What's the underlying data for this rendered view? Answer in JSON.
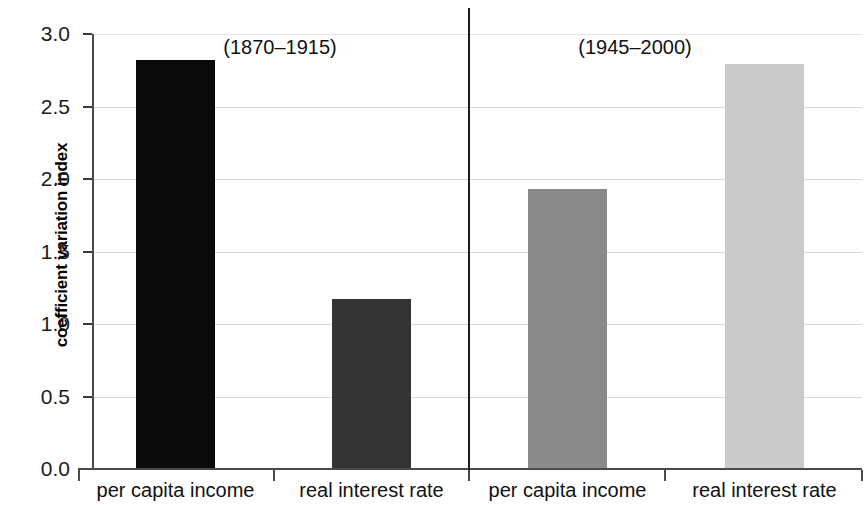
{
  "chart_data": {
    "type": "bar",
    "title": "",
    "subtitle": "",
    "xlabel": "",
    "ylabel": "coefficient variation index",
    "ylim": [
      0.0,
      3.0
    ],
    "grid": true,
    "legend": null,
    "categories": [
      "per capita income",
      "real interest rate",
      "per capita income",
      "real interest rate"
    ],
    "values": [
      2.82,
      1.17,
      1.93,
      2.79
    ],
    "bar_colors": [
      "#0a0a0a",
      "#343434",
      "#8a8a8a",
      "#cacaca"
    ],
    "groups": [
      {
        "label": "(1870–1915)",
        "categories": [
          "per capita income",
          "real interest rate"
        ],
        "values": [
          2.82,
          1.17
        ]
      },
      {
        "label": "(1945–2000)",
        "categories": [
          "per capita income",
          "real interest rate"
        ],
        "values": [
          1.93,
          2.79
        ]
      }
    ],
    "ytick_labels": [
      "0.0",
      "0.5",
      "1.0",
      "1.5",
      "2.0",
      "2.5",
      "3.0"
    ],
    "ytick_values": [
      0.0,
      0.5,
      1.0,
      1.5,
      2.0,
      2.5,
      3.0
    ],
    "annotations": [
      "(1870–1915)",
      "(1945–2000)"
    ]
  },
  "axis": {
    "y_title": "coefficient variation index"
  },
  "ticks": {
    "y": [
      {
        "label": "3.0",
        "value": 3.0
      },
      {
        "label": "2.5",
        "value": 2.5
      },
      {
        "label": "2.0",
        "value": 2.0
      },
      {
        "label": "1.5",
        "value": 1.5
      },
      {
        "label": "1.0",
        "value": 1.0
      },
      {
        "label": "0.5",
        "value": 0.5
      },
      {
        "label": "0.0",
        "value": 0.0
      }
    ]
  },
  "groups": [
    {
      "label": "(1870–1915)"
    },
    {
      "label": "(1945–2000)"
    }
  ],
  "bars": [
    {
      "label": "per capita income",
      "value": 2.82,
      "color": "#0a0a0a"
    },
    {
      "label": "real interest rate",
      "value": 1.17,
      "color": "#343434"
    },
    {
      "label": "per capita income",
      "value": 1.93,
      "color": "#8a8a8a"
    },
    {
      "label": "real interest rate",
      "value": 2.79,
      "color": "#cacaca"
    }
  ]
}
